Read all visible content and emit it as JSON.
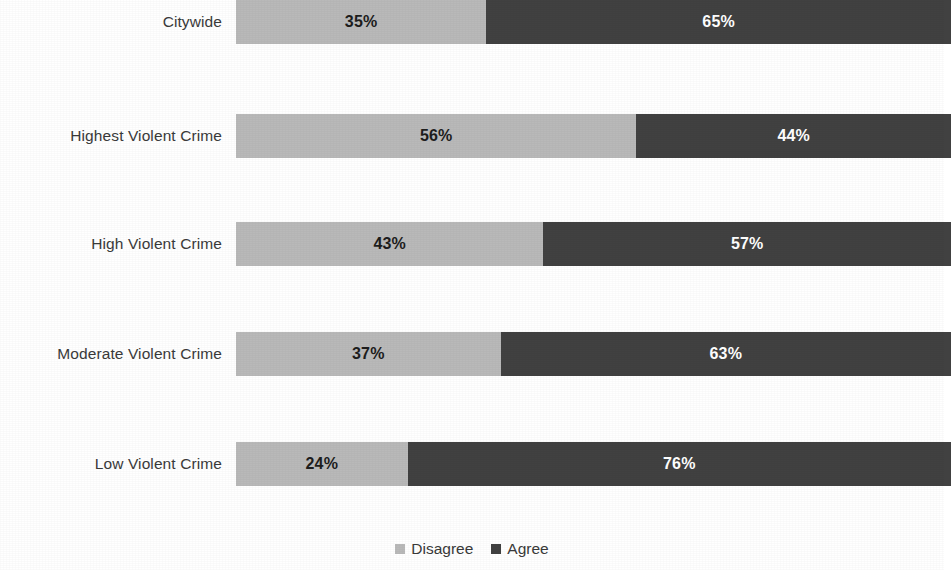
{
  "chart_data": {
    "type": "bar",
    "orientation": "horizontal",
    "stacked": true,
    "stacked_mode": "percent",
    "title": "",
    "subtitle": "",
    "xlabel": "",
    "ylabel": "",
    "xlim": [
      0,
      100
    ],
    "grid": false,
    "legend_position": "bottom",
    "categories": [
      "Citywide",
      "Highest Violent Crime",
      "High Violent Crime",
      "Moderate Violent Crime",
      "Low Violent Crime"
    ],
    "series": [
      {
        "name": "Disagree",
        "color": "#b9b9b9",
        "values": [
          35,
          56,
          43,
          37,
          24
        ],
        "labels": [
          "35%",
          "56%",
          "43%",
          "37%",
          "24%"
        ]
      },
      {
        "name": "Agree",
        "color": "#414141",
        "values": [
          65,
          44,
          57,
          63,
          76
        ],
        "labels": [
          "65%",
          "44%",
          "57%",
          "63%",
          "76%"
        ]
      }
    ]
  },
  "legend": {
    "items": [
      {
        "label": "Disagree",
        "color": "#b9b9b9",
        "swatch_name": "legend-swatch-disagree"
      },
      {
        "label": "Agree",
        "color": "#414141",
        "swatch_name": "legend-swatch-agree"
      }
    ]
  },
  "colors": {
    "disagree": "#b9b9b9",
    "agree": "#414141",
    "label_text": "#3a3a3a",
    "dark_value_text": "#1d1d1d",
    "light_value_text": "#ffffff",
    "background": "#ffffff"
  }
}
